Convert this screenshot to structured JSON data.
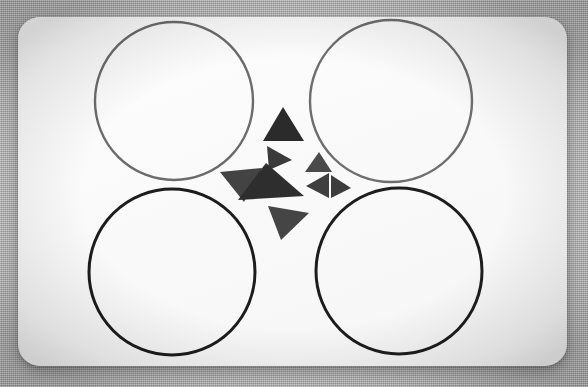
{
  "scene": {
    "title": "Rounded card with four circles and a cluster of triangles",
    "canvas": {
      "width": 588,
      "height": 387
    },
    "background": {
      "name": "textured-gray-backdrop",
      "color": "#bdbdbd",
      "texture": "fine dithered noise",
      "vignette": true
    },
    "card": {
      "name": "white-rounded-card",
      "x": 18,
      "y": 17,
      "width": 549,
      "height": 349,
      "radius": 22,
      "fill": "#fafafa",
      "shadow": "soft drop shadow"
    }
  },
  "circles": [
    {
      "id": "circle-top-left",
      "label": "Top left circle",
      "cx": 174,
      "cy": 101,
      "r": 79,
      "stroke": "#6b6b6b",
      "stroke_width": 2.4,
      "fill": "none"
    },
    {
      "id": "circle-top-right",
      "label": "Top right circle",
      "cx": 391,
      "cy": 101,
      "r": 81,
      "stroke": "#6e6e6e",
      "stroke_width": 2.4,
      "fill": "none"
    },
    {
      "id": "circle-bottom-left",
      "label": "Bottom left circle",
      "cx": 172,
      "cy": 272,
      "r": 83,
      "stroke": "#1c1c1c",
      "stroke_width": 3.0,
      "fill": "none"
    },
    {
      "id": "circle-bottom-right",
      "label": "Bottom right circle",
      "cx": 399,
      "cy": 271,
      "r": 83,
      "stroke": "#1d1d1d",
      "stroke_width": 3.0,
      "fill": "none"
    }
  ],
  "triangles": [
    {
      "id": "triangle-top",
      "label": "Top triangle, pointing up",
      "points": "283,107 304,141 263,141",
      "fill": "#2b2b2b",
      "size": "medium"
    },
    {
      "id": "triangle-upper-left",
      "label": "Upper middle triangle, pointing right",
      "points": "267,146 292,160 269,170",
      "fill": "#3a3a3a",
      "size": "small"
    },
    {
      "id": "triangle-upper-right",
      "label": "Upper right triangle, pointing up",
      "points": "319,152 332,172 305,172",
      "fill": "#4a4a4a",
      "size": "small"
    },
    {
      "id": "triangle-left",
      "label": "Left triangle, pointing down-left",
      "points": "220,172 262,168 244,202",
      "fill": "#434343",
      "size": "medium"
    },
    {
      "id": "triangle-center",
      "label": "Center large triangle, pointing down-left",
      "points": "238,200 266,163 304,196",
      "fill": "#2e2e2e",
      "size": "large"
    },
    {
      "id": "triangle-mid-right",
      "label": "Middle right triangle, pointing left",
      "points": "306,186 329,173 329,198",
      "fill": "#3f3f3f",
      "size": "small"
    },
    {
      "id": "triangle-far-right",
      "label": "Far right triangle, pointing right",
      "points": "351,188 331,175 331,198",
      "fill": "#3d3d3d",
      "size": "small"
    },
    {
      "id": "triangle-bottom",
      "label": "Bottom triangle, pointing down-left",
      "points": "268,206 309,213 281,240",
      "fill": "#454545",
      "size": "medium"
    }
  ],
  "counts": {
    "circles": 4,
    "triangles": 8
  }
}
